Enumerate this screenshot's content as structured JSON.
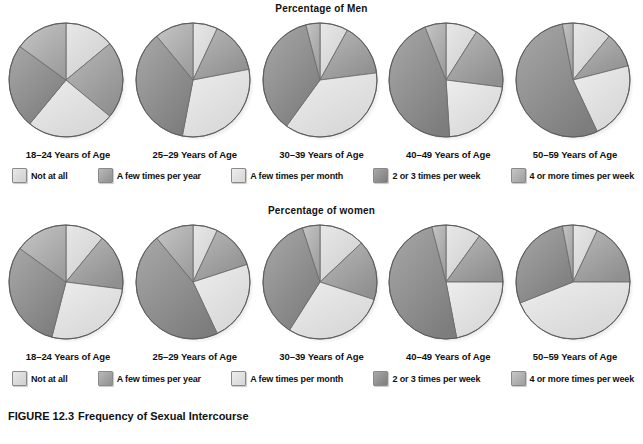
{
  "figure": {
    "caption_number": "FIGURE 12.3",
    "caption_title": "Frequency of Sexual Intercourse",
    "cut_off_source_line": " "
  },
  "categories": [
    {
      "key": "not_at_all",
      "label": "Not at all",
      "color": "#e8e8e8",
      "color_dark": "#cfcfcf"
    },
    {
      "key": "few_year",
      "label": "A few times per year",
      "color": "#b9b9b9",
      "color_dark": "#8f8f8f"
    },
    {
      "key": "few_month",
      "label": "A few times per month",
      "color": "#ededed",
      "color_dark": "#d6d6d6"
    },
    {
      "key": "two_three_wk",
      "label": "2 or 3 times per week",
      "color": "#a8a8a8",
      "color_dark": "#7d7d7d"
    },
    {
      "key": "four_plus_wk",
      "label": "4 or more times per week",
      "color": "#c6c6c6",
      "color_dark": "#9d9d9d"
    }
  ],
  "rows": [
    {
      "title": "Percentage of Men",
      "groups": [
        {
          "age_label": "18–24 Years of Age",
          "values": [
            14,
            22,
            25,
            24,
            15
          ]
        },
        {
          "age_label": "25–29 Years of Age",
          "values": [
            7,
            15,
            31,
            36,
            11
          ]
        },
        {
          "age_label": "30–39 Years of Age",
          "values": [
            8,
            15,
            37,
            36,
            4
          ]
        },
        {
          "age_label": "40–49 Years of Age",
          "values": [
            9,
            18,
            22,
            45,
            6
          ]
        },
        {
          "age_label": "50–59 Years of Age",
          "values": [
            11,
            10,
            22,
            54,
            3
          ]
        }
      ]
    },
    {
      "title": "Percentage of women",
      "groups": [
        {
          "age_label": "18–24 Years of Age",
          "values": [
            11,
            16,
            27,
            31,
            15
          ]
        },
        {
          "age_label": "25–29 Years of Age",
          "values": [
            7,
            13,
            23,
            46,
            11
          ]
        },
        {
          "age_label": "30–39 Years of Age",
          "values": [
            13,
            17,
            29,
            36,
            5
          ]
        },
        {
          "age_label": "40–49 Years of Age",
          "values": [
            10,
            15,
            22,
            49,
            4
          ]
        },
        {
          "age_label": "50–59 Years of Age",
          "values": [
            7,
            18,
            44,
            28,
            3
          ]
        }
      ]
    }
  ],
  "chart_data": {
    "type": "pie",
    "legend_position": "below-each-row",
    "categories": [
      "Not at all",
      "A few times per year",
      "A few times per month",
      "2 or 3 times per week",
      "4 or more times per week"
    ],
    "units": "percent",
    "panels": [
      {
        "panel": "Percentage of Men",
        "group": "18–24 Years of Age",
        "values": [
          14,
          22,
          25,
          24,
          15
        ]
      },
      {
        "panel": "Percentage of Men",
        "group": "25–29 Years of Age",
        "values": [
          7,
          15,
          31,
          36,
          11
        ]
      },
      {
        "panel": "Percentage of Men",
        "group": "30–39 Years of Age",
        "values": [
          8,
          15,
          37,
          36,
          4
        ]
      },
      {
        "panel": "Percentage of Men",
        "group": "40–49 Years of Age",
        "values": [
          9,
          18,
          22,
          45,
          6
        ]
      },
      {
        "panel": "Percentage of Men",
        "group": "50–59 Years of Age",
        "values": [
          11,
          10,
          22,
          54,
          3
        ]
      },
      {
        "panel": "Percentage of women",
        "group": "18–24 Years of Age",
        "values": [
          11,
          16,
          27,
          31,
          15
        ]
      },
      {
        "panel": "Percentage of women",
        "group": "25–29 Years of Age",
        "values": [
          7,
          13,
          23,
          46,
          11
        ]
      },
      {
        "panel": "Percentage of women",
        "group": "30–39 Years of Age",
        "values": [
          13,
          17,
          29,
          36,
          5
        ]
      },
      {
        "panel": "Percentage of women",
        "group": "40–49 Years of Age",
        "values": [
          10,
          15,
          22,
          49,
          4
        ]
      },
      {
        "panel": "Percentage of women",
        "group": "50–59 Years of Age",
        "values": [
          7,
          18,
          44,
          28,
          3
        ]
      }
    ]
  }
}
